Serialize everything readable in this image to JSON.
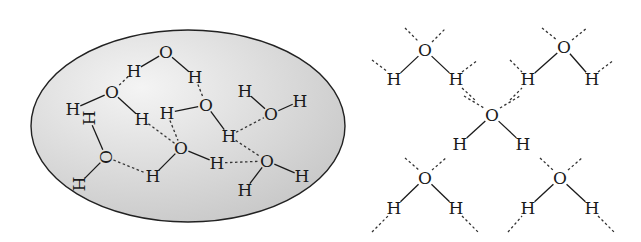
{
  "figure": {
    "left_panel": {
      "label": "liquid-water-cluster",
      "ellipse": {
        "cx": 188,
        "cy": 126,
        "rx": 157,
        "ry": 96,
        "fill_light": "#f4f4f4",
        "fill_dark": "#c9c9c9",
        "stroke": "#222222"
      },
      "atoms": [
        {
          "el": "O",
          "x": 166,
          "y": 52
        },
        {
          "el": "H",
          "x": 134,
          "y": 71
        },
        {
          "el": "H",
          "x": 195,
          "y": 77
        },
        {
          "el": "O",
          "x": 112,
          "y": 92
        },
        {
          "el": "H",
          "x": 73,
          "y": 109
        },
        {
          "el": "H",
          "x": 89,
          "y": 118,
          "rot": 90
        },
        {
          "el": "H",
          "x": 142,
          "y": 119
        },
        {
          "el": "H",
          "x": 167,
          "y": 113
        },
        {
          "el": "O",
          "x": 206,
          "y": 105
        },
        {
          "el": "H",
          "x": 245,
          "y": 91
        },
        {
          "el": "O",
          "x": 271,
          "y": 114
        },
        {
          "el": "H",
          "x": 300,
          "y": 101
        },
        {
          "el": "H",
          "x": 229,
          "y": 136
        },
        {
          "el": "O",
          "x": 181,
          "y": 148
        },
        {
          "el": "H",
          "x": 153,
          "y": 176
        },
        {
          "el": "H",
          "x": 217,
          "y": 163
        },
        {
          "el": "O",
          "x": 267,
          "y": 161
        },
        {
          "el": "H",
          "x": 245,
          "y": 190
        },
        {
          "el": "H",
          "x": 302,
          "y": 176
        },
        {
          "el": "O",
          "x": 106,
          "y": 157,
          "rot": 90
        },
        {
          "el": "H",
          "x": 79,
          "y": 184,
          "rot": 90
        }
      ],
      "bonds": [
        [
          166,
          52,
          134,
          71
        ],
        [
          166,
          52,
          195,
          77
        ],
        [
          112,
          92,
          73,
          109
        ],
        [
          112,
          92,
          142,
          119
        ],
        [
          206,
          105,
          167,
          113
        ],
        [
          206,
          105,
          229,
          136
        ],
        [
          271,
          114,
          245,
          91
        ],
        [
          271,
          114,
          300,
          101
        ],
        [
          181,
          148,
          153,
          176
        ],
        [
          181,
          148,
          217,
          163
        ],
        [
          267,
          161,
          245,
          190
        ],
        [
          267,
          161,
          302,
          176
        ],
        [
          106,
          157,
          89,
          118
        ],
        [
          106,
          157,
          79,
          184
        ]
      ],
      "hbonds": [
        [
          134,
          71,
          112,
          92
        ],
        [
          195,
          77,
          206,
          105
        ],
        [
          142,
          119,
          181,
          148
        ],
        [
          167,
          113,
          181,
          148
        ],
        [
          229,
          136,
          271,
          114
        ],
        [
          229,
          136,
          267,
          161
        ],
        [
          217,
          163,
          267,
          161
        ],
        [
          106,
          157,
          153,
          176
        ]
      ]
    },
    "right_panel": {
      "label": "ice-tetrahedral-lattice",
      "molecules": [
        {
          "O": [
            425,
            50
          ],
          "H1": [
            394,
            79
          ],
          "H2": [
            456,
            79
          ]
        },
        {
          "O": [
            564,
            47
          ],
          "H1": [
            528,
            79
          ],
          "H2": [
            592,
            79
          ]
        },
        {
          "O": [
            492,
            115
          ],
          "H1": [
            460,
            144
          ],
          "H2": [
            523,
            144
          ]
        },
        {
          "O": [
            425,
            178
          ],
          "H1": [
            394,
            208
          ],
          "H2": [
            456,
            208
          ]
        },
        {
          "O": [
            560,
            178
          ],
          "H1": [
            528,
            208
          ],
          "H2": [
            592,
            208
          ]
        }
      ],
      "hbonds": [
        [
          405,
          28,
          419,
          42
        ],
        [
          432,
          42,
          446,
          28
        ],
        [
          542,
          28,
          557,
          40
        ],
        [
          572,
          40,
          587,
          28
        ],
        [
          372,
          60,
          388,
          72
        ],
        [
          462,
          72,
          478,
          60
        ],
        [
          510,
          60,
          522,
          72
        ],
        [
          598,
          72,
          614,
          60
        ],
        [
          464,
          96,
          484,
          108
        ],
        [
          500,
          108,
          520,
          96
        ],
        [
          405,
          158,
          419,
          170
        ],
        [
          432,
          170,
          446,
          158
        ],
        [
          540,
          158,
          553,
          170
        ],
        [
          568,
          170,
          582,
          158
        ],
        [
          372,
          232,
          388,
          216
        ],
        [
          462,
          216,
          478,
          232
        ],
        [
          508,
          232,
          522,
          216
        ],
        [
          598,
          216,
          614,
          232
        ],
        [
          462,
          88,
          475,
          100
        ],
        [
          510,
          100,
          522,
          88
        ]
      ],
      "atom_labels": {
        "oxygen": "O",
        "hydrogen": "H"
      }
    }
  }
}
